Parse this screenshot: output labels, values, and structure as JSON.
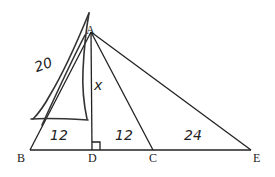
{
  "diagram": {
    "points": {
      "A": {
        "label": "A",
        "x": 91,
        "y": 32
      },
      "B": {
        "label": "B",
        "x": 30,
        "y": 150
      },
      "D": {
        "label": "D",
        "x": 92,
        "y": 150
      },
      "C": {
        "label": "C",
        "x": 153,
        "y": 150
      },
      "E": {
        "label": "E",
        "x": 251,
        "y": 150
      }
    },
    "segments": [
      "AB",
      "AD",
      "AC",
      "AE",
      "BE"
    ],
    "right_angle_at": "D",
    "annotations": {
      "ab_length": "20",
      "ad_length": "x",
      "bd_length": "12",
      "dc_length": "12",
      "ce_length": "24"
    }
  }
}
